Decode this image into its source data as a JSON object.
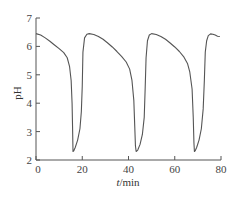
{
  "chart_data": {
    "type": "line",
    "title": "",
    "xlabel": "t/min",
    "ylabel": "pH",
    "xlim": [
      0,
      80
    ],
    "ylim": [
      2,
      7
    ],
    "xticks": [
      0,
      20,
      40,
      60,
      80
    ],
    "yticks": [
      2,
      3,
      4,
      5,
      6,
      7
    ],
    "grid": false,
    "legend": null,
    "series": [
      {
        "name": "pH oscillation",
        "color": "#555555",
        "x": [
          0,
          2,
          4,
          6,
          8,
          10,
          12,
          13.5,
          14.5,
          15.2,
          15.6,
          15.8,
          16.0,
          16.3,
          17,
          18,
          19,
          19.6,
          20.0,
          20.3,
          21,
          22,
          23,
          25,
          27,
          29,
          31,
          33,
          35,
          37,
          39,
          40.5,
          41.5,
          42.3,
          42.7,
          43.0,
          43.3,
          44,
          45,
          46,
          46.8,
          47.2,
          47.6,
          48.2,
          49,
          50,
          52,
          54,
          56,
          58,
          60,
          62,
          64,
          65.5,
          66.5,
          67.5,
          68.0,
          68.3,
          68.5,
          68.8,
          69.5,
          70.5,
          71.5,
          72.3,
          72.8,
          73.2,
          73.8,
          74.5,
          75.5,
          76.5,
          77.5,
          78.5,
          79.5
        ],
        "y": [
          6.45,
          6.4,
          6.3,
          6.18,
          6.05,
          5.92,
          5.78,
          5.6,
          5.3,
          4.8,
          4.0,
          3.2,
          2.3,
          2.32,
          2.45,
          2.7,
          3.1,
          3.7,
          4.6,
          5.8,
          6.3,
          6.43,
          6.45,
          6.42,
          6.35,
          6.25,
          6.12,
          5.98,
          5.82,
          5.65,
          5.45,
          5.2,
          4.8,
          4.1,
          3.2,
          2.5,
          2.3,
          2.35,
          2.55,
          2.9,
          3.5,
          4.5,
          5.6,
          6.2,
          6.4,
          6.45,
          6.42,
          6.35,
          6.25,
          6.12,
          5.98,
          5.82,
          5.62,
          5.4,
          5.1,
          4.5,
          3.5,
          2.6,
          2.3,
          2.32,
          2.45,
          2.7,
          3.1,
          3.8,
          4.8,
          5.8,
          6.2,
          6.38,
          6.44,
          6.43,
          6.4,
          6.36,
          6.35
        ]
      }
    ]
  },
  "axes": {
    "x_label_italic": "t",
    "x_label_unit": "/min",
    "y_label": "pH"
  }
}
